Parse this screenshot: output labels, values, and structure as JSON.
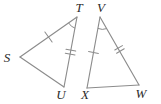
{
  "figure": {
    "type": "geometry-diagram",
    "background_color": "#ffffff",
    "stroke_color": "#8c8c8c",
    "label_color": "#2b2b2b",
    "triangles": [
      {
        "name": "triangle-STU",
        "vertices": [
          {
            "label": "S",
            "x": 20,
            "y": 57,
            "label_x": 7,
            "label_y": 59
          },
          {
            "label": "T",
            "x": 77,
            "y": 17,
            "label_x": 79,
            "label_y": 9
          },
          {
            "label": "U",
            "x": 64,
            "y": 87,
            "label_x": 61,
            "label_y": 96
          }
        ],
        "sides": [
          {
            "name": "side-ST",
            "from": "S",
            "to": "T",
            "ticks": 1
          },
          {
            "name": "side-TU",
            "from": "T",
            "to": "U",
            "ticks": 2
          },
          {
            "name": "side-SU",
            "from": "S",
            "to": "U",
            "ticks": 0
          }
        ],
        "angle_marks": [
          {
            "name": "angle-T",
            "at": "T",
            "arcs": 1
          }
        ]
      },
      {
        "name": "triangle-VXW",
        "vertices": [
          {
            "label": "V",
            "x": 100,
            "y": 17,
            "label_x": 101,
            "label_y": 9
          },
          {
            "label": "X",
            "x": 87,
            "y": 88,
            "label_x": 85,
            "label_y": 96
          },
          {
            "label": "W",
            "x": 139,
            "y": 85,
            "label_x": 141,
            "label_y": 95
          }
        ],
        "sides": [
          {
            "name": "side-VX",
            "from": "V",
            "to": "X",
            "ticks": 1
          },
          {
            "name": "side-VW",
            "from": "V",
            "to": "W",
            "ticks": 2
          },
          {
            "name": "side-XW",
            "from": "X",
            "to": "W",
            "ticks": 0
          }
        ],
        "angle_marks": [
          {
            "name": "angle-V",
            "at": "V",
            "arcs": 1
          }
        ]
      }
    ],
    "labels": {
      "S": "S",
      "T": "T",
      "U": "U",
      "V": "V",
      "W": "W",
      "X": "X"
    }
  }
}
